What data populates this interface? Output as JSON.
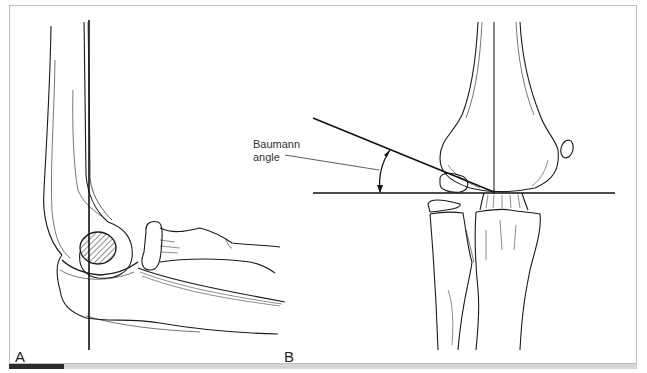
{
  "figure": {
    "panels": [
      {
        "id": "A",
        "label": "A",
        "view": "lateral elbow"
      },
      {
        "id": "B",
        "label": "B",
        "view": "anteroposterior elbow"
      }
    ],
    "annotations": {
      "baumann_line1": "Baumann",
      "baumann_line2": "angle"
    },
    "colors": {
      "line": "#1a1a1a",
      "frame": "#bdbdbd",
      "accent_bar": "#2b2b2b",
      "bar": "#d6d6d6"
    }
  }
}
